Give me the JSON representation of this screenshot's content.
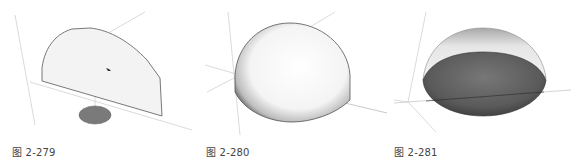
{
  "figures": [
    {
      "id": "fig-279",
      "caption": "图 2-279",
      "description": "Half-disk face (semicircle) standing vertically with a small circular path on the ground plane",
      "colors": {
        "face": "#f2f2f2",
        "edge": "#6a6a6a",
        "circle": "#7a7a7a",
        "axis": "#c8c8c8"
      }
    },
    {
      "id": "fig-280",
      "caption": "图 2-280",
      "description": "Solid hemisphere (dome) shown from above",
      "colors": {
        "surface_light": "#ffffff",
        "surface_shade": "#8a8a8a",
        "axis": "#c8c8c8"
      }
    },
    {
      "id": "fig-281",
      "caption": "图 2-281",
      "description": "Hemisphere viewed from below showing the dark flat base face",
      "colors": {
        "top_light": "#f0f0f0",
        "base_dark": "#555555",
        "axis": "#c8c8c8"
      }
    }
  ]
}
